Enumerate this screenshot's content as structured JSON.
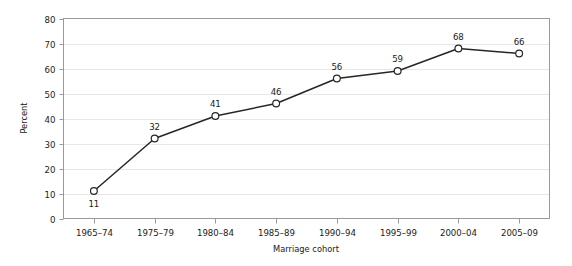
{
  "chart_data": {
    "type": "line",
    "title": "",
    "xlabel": "Marriage cohort",
    "ylabel": "Percent",
    "categories": [
      "1965–74",
      "1975–79",
      "1980–84",
      "1985–89",
      "1990–94",
      "1995–99",
      "2000–04",
      "2005–09"
    ],
    "values": [
      11,
      32,
      41,
      46,
      56,
      59,
      68,
      66
    ],
    "point_labels": [
      "11",
      "32",
      "41",
      "46",
      "56",
      "59",
      "68",
      "66"
    ],
    "point_label_positions": [
      "below",
      "above",
      "above",
      "above",
      "above",
      "above",
      "above",
      "above"
    ],
    "ylim": [
      0,
      80
    ],
    "ytick_values": [
      0,
      10,
      20,
      30,
      40,
      50,
      60,
      70,
      80
    ],
    "ytick_labels": [
      "0",
      "10",
      "20",
      "30",
      "40",
      "50",
      "60",
      "70",
      "80"
    ],
    "grid": "horizontal",
    "legend": "none",
    "series": [
      {
        "name": "Percent",
        "values": [
          11,
          32,
          41,
          46,
          56,
          59,
          68,
          66
        ]
      }
    ],
    "colors": {
      "line": "#262626",
      "marker_fill": "#ffffff",
      "marker_stroke": "#262626",
      "grid": "#e8e8e8",
      "axis": "#9a9a9a",
      "text": "#1a1a1a",
      "background": "#ffffff"
    }
  }
}
